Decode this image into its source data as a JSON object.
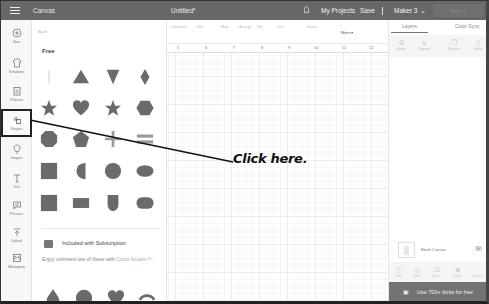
{
  "topbar": {
    "app_title": "Canvas",
    "doc_title": "Untitled*",
    "my_projects": "My Projects",
    "save": "Save",
    "machine": "Maker 3",
    "machine_chevron": "⌄",
    "make_button": "Make It"
  },
  "leftnav": {
    "items": [
      {
        "label": "New",
        "icon": "plus-circle-icon"
      },
      {
        "label": "Templates",
        "icon": "shirt-icon"
      },
      {
        "label": "Projects",
        "icon": "clipboard-icon"
      },
      {
        "label": "Shapes",
        "icon": "shapes-icon",
        "active": true
      },
      {
        "label": "Images",
        "icon": "lightbulb-icon"
      },
      {
        "label": "Text",
        "icon": "text-icon"
      },
      {
        "label": "Phrases",
        "icon": "speech-bubble-icon"
      },
      {
        "label": "Upload",
        "icon": "upload-icon"
      },
      {
        "label": "Monogram",
        "icon": "monogram-icon"
      }
    ]
  },
  "panel": {
    "back": "Back",
    "free_title": "Free",
    "free_shapes": [
      "line",
      "triangle",
      "inverted-triangle",
      "diamond",
      "star",
      "heart",
      "star-five",
      "hexagon",
      "octagon",
      "pentagon",
      "plus",
      "equals",
      "square",
      "half-circle",
      "circle",
      "ellipse",
      "square-large",
      "rectangle",
      "arch",
      "oval"
    ],
    "subscription_title": "Included with Subscription",
    "subscription_desc": "Enjoy unlimited use of these with ",
    "subscription_link": "Cricut Access™",
    "subscription_desc_end": ".",
    "sub_shapes": [
      "teardrop",
      "scalloped-circle",
      "heart",
      "arc"
    ]
  },
  "toolbar": {
    "items": [
      "Operation",
      "Linetype",
      "Fill",
      "Select All",
      "Edit",
      "Align",
      "Arrange",
      "Flip",
      "Size",
      "Rotate",
      "Position"
    ],
    "more": "More ▾"
  },
  "ruler": {
    "numbers": [
      "5",
      "6",
      "7",
      "8",
      "9",
      "10",
      "11",
      "12"
    ]
  },
  "rightpanel": {
    "tabs": [
      "Layers",
      "Color Sync"
    ],
    "tools": [
      "Group",
      "Ungroup",
      "Duplicate",
      "Delete"
    ],
    "layer_label": "Blank Canvas",
    "actions": [
      "Slice",
      "Weld",
      "Attach",
      "Flatten",
      "Contour"
    ],
    "promo": "Use 700+ fonts for free"
  },
  "annotation": {
    "text": "Click here."
  },
  "colors": {
    "topbar": "#676767",
    "shape_fill": "#6a6a6a",
    "promo_bar": "#737373",
    "accent_link": "#9db0a6"
  }
}
